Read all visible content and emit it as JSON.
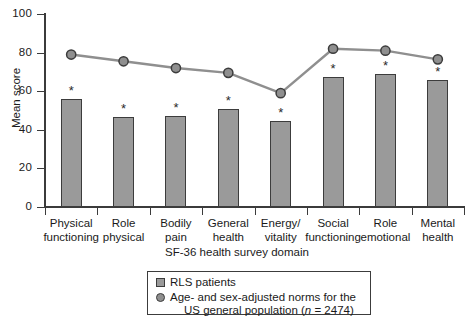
{
  "chart_data": {
    "type": "bar",
    "title": "",
    "xlabel": "SF-36 health survey domain",
    "ylabel": "Mean score",
    "ylim": [
      0,
      100
    ],
    "yticks": [
      0,
      20,
      40,
      60,
      80,
      100
    ],
    "grid": false,
    "legend_position": "bottom-center",
    "categories": [
      "Physical functioning",
      "Role physical",
      "Bodily pain",
      "General health",
      "Energy/ vitality",
      "Social functioning",
      "Role emotional",
      "Mental health"
    ],
    "category_lines": [
      [
        "Physical",
        "functioning"
      ],
      [
        "Role",
        "physical"
      ],
      [
        "Bodily",
        "pain"
      ],
      [
        "General",
        "health"
      ],
      [
        "Energy/",
        "vitality"
      ],
      [
        "Social",
        "functioning"
      ],
      [
        "Role",
        "emotional"
      ],
      [
        "Mental",
        "health"
      ]
    ],
    "series": [
      {
        "name": "RLS patients",
        "render": "bar",
        "color": "#9a9a9a",
        "values": [
          56,
          46.5,
          47,
          51,
          44.5,
          67.5,
          69,
          66
        ],
        "annotations": [
          "*",
          "*",
          "*",
          "*",
          "*",
          "*",
          "*",
          "*"
        ]
      },
      {
        "name": "Age- and sex-adjusted norms for the US general population (n = 2474)",
        "render": "line",
        "color": "#8f8f8f",
        "values": [
          79,
          75.5,
          72,
          69.5,
          59,
          82,
          81,
          76.5
        ]
      }
    ]
  },
  "legend": {
    "item1_label": "RLS patients",
    "item2_line1": "Age- and sex-adjusted norms for the",
    "item2_line2_pre": "US general population (",
    "item2_line2_ital": "n",
    "item2_line2_post": " = 2474)"
  }
}
